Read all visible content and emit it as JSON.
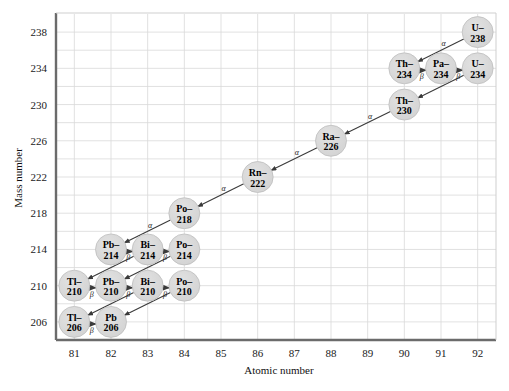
{
  "figure": {
    "background": "#ffffff",
    "plot_border_color": "#6b6b6b",
    "grid_color": "#d9d9d9",
    "node_fill": "#d8d8d8",
    "node_stroke": "#b9b9b9",
    "arrow_color": "#3a3a3a"
  },
  "axes": {
    "x": {
      "label": "Atomic number",
      "ticks": [
        "81",
        "82",
        "83",
        "84",
        "85",
        "86",
        "87",
        "88",
        "89",
        "90",
        "91",
        "92"
      ],
      "min": 80.5,
      "max": 92.5
    },
    "y": {
      "label": "Mass number",
      "ticks": [
        "238",
        "234",
        "230",
        "226",
        "222",
        "218",
        "214",
        "210",
        "206"
      ],
      "min": 204,
      "max": 240
    }
  },
  "chart_data": {
    "type": "scatter",
    "title": "",
    "xlabel": "Atomic number",
    "ylabel": "Mass number",
    "xlim": [
      80.5,
      92.5
    ],
    "ylim": [
      204,
      240
    ],
    "grid": true,
    "legend": null,
    "nodes": [
      {
        "id": "U238",
        "line1": "U–",
        "line2": "238",
        "z": 92,
        "a": 238
      },
      {
        "id": "Th234",
        "line1": "Th–",
        "line2": "234",
        "z": 90,
        "a": 234
      },
      {
        "id": "Pa234",
        "line1": "Pa–",
        "line2": "234",
        "z": 91,
        "a": 234
      },
      {
        "id": "U234",
        "line1": "U–",
        "line2": "234",
        "z": 92,
        "a": 234
      },
      {
        "id": "Th230",
        "line1": "Th–",
        "line2": "230",
        "z": 90,
        "a": 230
      },
      {
        "id": "Ra226",
        "line1": "Ra–",
        "line2": "226",
        "z": 88,
        "a": 226
      },
      {
        "id": "Rn222",
        "line1": "Rn–",
        "line2": "222",
        "z": 86,
        "a": 222
      },
      {
        "id": "Po218",
        "line1": "Po–",
        "line2": "218",
        "z": 84,
        "a": 218
      },
      {
        "id": "Pb214",
        "line1": "Pb–",
        "line2": "214",
        "z": 82,
        "a": 214
      },
      {
        "id": "Bi214",
        "line1": "Bi–",
        "line2": "214",
        "z": 83,
        "a": 214
      },
      {
        "id": "Po214",
        "line1": "Po–",
        "line2": "214",
        "z": 84,
        "a": 214
      },
      {
        "id": "Tl210",
        "line1": "Tl–",
        "line2": "210",
        "z": 81,
        "a": 210
      },
      {
        "id": "Pb210",
        "line1": "Pb–",
        "line2": "210",
        "z": 82,
        "a": 210
      },
      {
        "id": "Bi210",
        "line1": "Bi–",
        "line2": "210",
        "z": 83,
        "a": 210
      },
      {
        "id": "Po210",
        "line1": "Po–",
        "line2": "210",
        "z": 84,
        "a": 210
      },
      {
        "id": "Tl206",
        "line1": "Tl–",
        "line2": "206",
        "z": 81,
        "a": 206
      },
      {
        "id": "Pb206",
        "line1": "Pb",
        "line2": "206",
        "z": 82,
        "a": 206
      }
    ],
    "decays": [
      {
        "from": "U238",
        "to": "Th234",
        "type": "alpha",
        "label": "α"
      },
      {
        "from": "Th234",
        "to": "Pa234",
        "type": "beta",
        "label": "β"
      },
      {
        "from": "Pa234",
        "to": "U234",
        "type": "beta",
        "label": "β"
      },
      {
        "from": "U234",
        "to": "Th230",
        "type": "alpha",
        "label": "α"
      },
      {
        "from": "Th230",
        "to": "Ra226",
        "type": "alpha",
        "label": "α"
      },
      {
        "from": "Ra226",
        "to": "Rn222",
        "type": "alpha",
        "label": "α"
      },
      {
        "from": "Rn222",
        "to": "Po218",
        "type": "alpha",
        "label": "α"
      },
      {
        "from": "Po218",
        "to": "Pb214",
        "type": "alpha",
        "label": "α"
      },
      {
        "from": "Pb214",
        "to": "Bi214",
        "type": "beta",
        "label": "β"
      },
      {
        "from": "Bi214",
        "to": "Po214",
        "type": "beta",
        "label": "β"
      },
      {
        "from": "Po214",
        "to": "Pb210",
        "type": "alpha",
        "label": "α"
      },
      {
        "from": "Bi214",
        "to": "Tl210",
        "type": "alpha",
        "label": "α"
      },
      {
        "from": "Tl210",
        "to": "Pb210",
        "type": "beta",
        "label": "β"
      },
      {
        "from": "Pb210",
        "to": "Bi210",
        "type": "beta",
        "label": "β"
      },
      {
        "from": "Bi210",
        "to": "Po210",
        "type": "beta",
        "label": "β"
      },
      {
        "from": "Po210",
        "to": "Pb206",
        "type": "alpha",
        "label": "α"
      },
      {
        "from": "Bi210",
        "to": "Tl206",
        "type": "alpha",
        "label": "α"
      },
      {
        "from": "Tl206",
        "to": "Pb206",
        "type": "beta",
        "label": "β"
      }
    ]
  }
}
